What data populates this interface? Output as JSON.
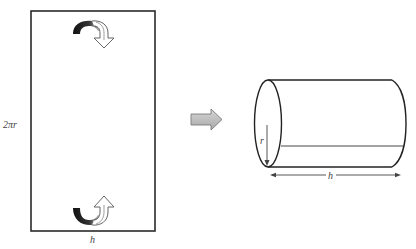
{
  "diagram": {
    "type": "net-to-solid",
    "rectangle": {
      "side_label": "2πr",
      "bottom_label": "h"
    },
    "curl_arrows": {
      "top": {
        "direction": "down",
        "meaning": "roll top edge"
      },
      "bottom": {
        "direction": "up",
        "meaning": "roll bottom edge"
      }
    },
    "transform_arrow": {
      "direction": "right",
      "color": "#b8b8b8"
    },
    "cylinder": {
      "radius_label": "r",
      "length_label": "h"
    },
    "colors": {
      "stroke": "#222222",
      "curl_fill": "#1a1a1a",
      "label": "#444444",
      "arrow_fill": "#bdbdbd",
      "arrow_stroke": "#7a7a7a"
    }
  }
}
